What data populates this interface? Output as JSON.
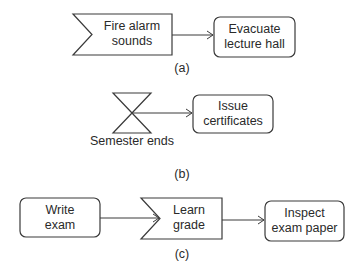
{
  "diagrams": {
    "a": {
      "caption": "(a)",
      "event": {
        "type": "signal-receive",
        "line1": "Fire alarm",
        "line2": "sounds"
      },
      "activity": {
        "line1": "Evacuate",
        "line2": "lecture hall"
      }
    },
    "b": {
      "caption": "(b)",
      "event": {
        "type": "time-event",
        "label": "Semester ends"
      },
      "activity": {
        "line1": "Issue",
        "line2": "certificates"
      }
    },
    "c": {
      "caption": "(c)",
      "activity1": {
        "line1": "Write",
        "line2": "exam"
      },
      "event": {
        "type": "signal-receive",
        "line1": "Learn",
        "line2": "grade"
      },
      "activity2": {
        "line1": "Inspect",
        "line2": "exam paper"
      }
    }
  },
  "colors": {
    "stroke": "#3a3a3a",
    "text": "#2a2a2a",
    "background": "#ffffff"
  }
}
